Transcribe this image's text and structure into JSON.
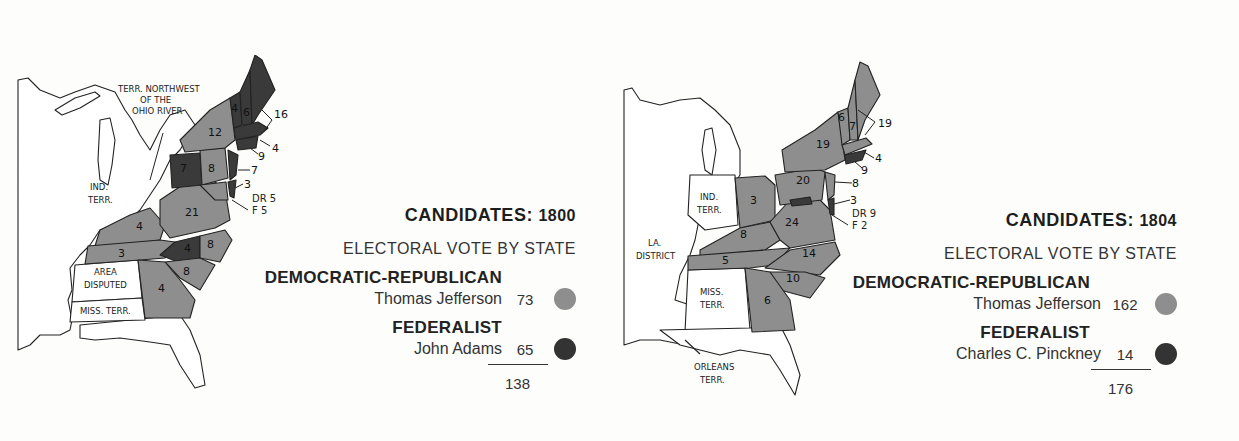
{
  "colors": {
    "democratic_republican": "#8e8e8e",
    "federalist": "#3a3a3a",
    "neutral": "#ffffff",
    "outline": "#222222"
  },
  "elections": [
    {
      "year": "1800",
      "title_prefix": "CANDIDATES:",
      "title_year": "1800",
      "subtitle": "ELECTORAL VOTE BY STATE",
      "parties": [
        {
          "party": "DEMOCRATIC-REPUBLICAN",
          "candidate": "Thomas Jefferson",
          "votes": "73",
          "swatch": "democratic-republican"
        },
        {
          "party": "FEDERALIST",
          "candidate": "John Adams",
          "votes": "65",
          "swatch": "federalist"
        }
      ],
      "total": "138",
      "map_labels": {
        "territory_nw": [
          "TERR. NORTHWEST",
          "OF THE",
          "OHIO RIVER"
        ],
        "ind_terr": [
          "IND.",
          "TERR."
        ],
        "disputed": [
          "AREA",
          "DISPUTED"
        ],
        "miss_terr": "MISS. TERR.",
        "split": {
          "dr": "DR 5",
          "f": "F  5"
        }
      },
      "state_votes": {
        "VT": "4",
        "NH": "6",
        "MA": "16",
        "NY": "12",
        "RI": "4",
        "CT": "9",
        "PA_west": "7",
        "PA_east": "8",
        "NJ": "7",
        "DE": "3",
        "MD_DR": "5",
        "MD_F": "5",
        "VA": "21",
        "KY": "4",
        "TN": "3",
        "NC_F": "4",
        "NC_DR": "8",
        "SC": "8",
        "GA": "4"
      }
    },
    {
      "year": "1804",
      "title_prefix": "CANDIDATES:",
      "title_year": "1804",
      "subtitle": "ELECTORAL VOTE BY STATE",
      "parties": [
        {
          "party": "DEMOCRATIC-REPUBLICAN",
          "candidate": "Thomas Jefferson",
          "votes": "162",
          "swatch": "democratic-republican"
        },
        {
          "party": "FEDERALIST",
          "candidate": "Charles C. Pinckney",
          "votes": "14",
          "swatch": "federalist"
        }
      ],
      "total": "176",
      "map_labels": {
        "la_district": [
          "LA.",
          "DISTRICT"
        ],
        "ind_terr": [
          "IND.",
          "TERR."
        ],
        "miss_terr": [
          "MISS.",
          "TERR."
        ],
        "orleans_terr": [
          "ORLEANS",
          "TERR."
        ],
        "split": {
          "dr": "DR 9",
          "f": "F  2"
        }
      },
      "state_votes": {
        "VT": "6",
        "NH": "7",
        "MA": "19",
        "NY": "19",
        "RI": "4",
        "CT": "9",
        "PA": "20",
        "NJ": "8",
        "DE": "3",
        "MD_DR": "9",
        "MD_F": "2",
        "OH": "3",
        "VA": "24",
        "KY": "8",
        "TN": "5",
        "NC": "14",
        "SC": "10",
        "GA": "6"
      }
    }
  ]
}
